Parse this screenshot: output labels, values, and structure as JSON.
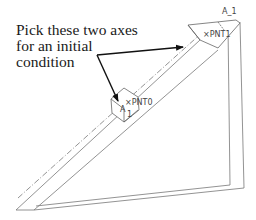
{
  "annotation": {
    "lines": [
      "Pick these two axes",
      "for an initial",
      "condition"
    ]
  },
  "labels": {
    "axis_top": "A_1",
    "point_top": "×PNT1",
    "point_mid": "×PNT0",
    "axis_mid_a": "A",
    "axis_mid_b": "1"
  },
  "colors": {
    "line": "#6a6a6a",
    "arrow": "#111111",
    "text": "#1a1a1a"
  }
}
